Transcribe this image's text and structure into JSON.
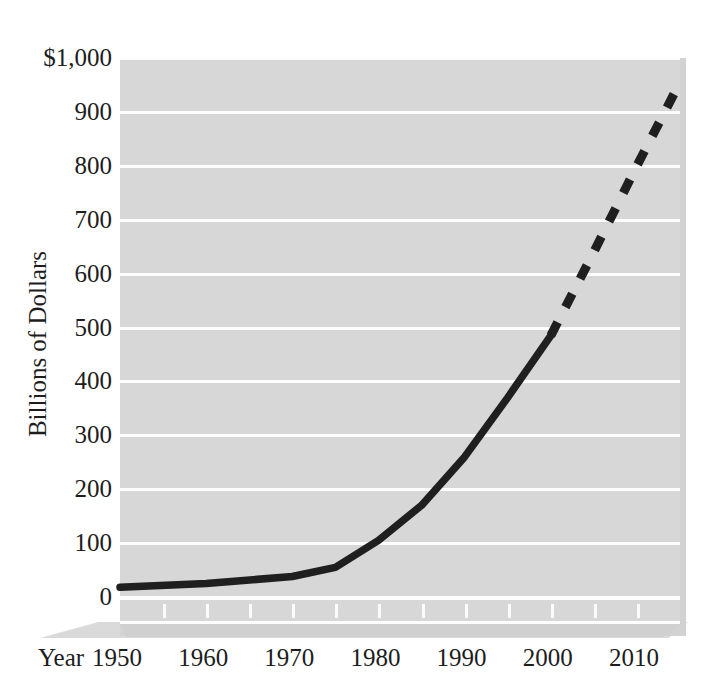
{
  "chart_data": {
    "type": "line",
    "title": "",
    "subtitle": "",
    "xlabel": "Year",
    "ylabel": "Billions of Dollars",
    "xlim": [
      1950,
      2015
    ],
    "ylim": [
      0,
      1000
    ],
    "grid": true,
    "legend": null,
    "x_ticks": [
      "1950",
      "1960",
      "1970",
      "1980",
      "1990",
      "2000",
      "2010"
    ],
    "x_tick_values": [
      1950,
      1960,
      1970,
      1980,
      1990,
      2000,
      2010
    ],
    "x_minor_tick_interval": 5,
    "y_ticks": [
      "0",
      "100",
      "200",
      "300",
      "400",
      "500",
      "600",
      "700",
      "800",
      "900",
      "$1,000"
    ],
    "y_tick_values": [
      0,
      100,
      200,
      300,
      400,
      500,
      600,
      700,
      800,
      900,
      1000
    ],
    "series": [
      {
        "name": "Actual",
        "style": "solid",
        "color": "#1f1f1f",
        "x": [
          1950,
          1960,
          1970,
          1975,
          1980,
          1985,
          1990,
          1995,
          2000
        ],
        "values": [
          18,
          25,
          38,
          55,
          105,
          170,
          260,
          370,
          485
        ]
      },
      {
        "name": "Projected",
        "style": "dashed",
        "color": "#1f1f1f",
        "x": [
          2000,
          2005,
          2010,
          2015
        ],
        "values": [
          485,
          640,
          800,
          955
        ]
      }
    ],
    "annotations": []
  },
  "axis": {
    "y_title": "Billions of Dollars",
    "x_title": "Year",
    "y_labels": [
      "$1,000",
      "900",
      "800",
      "700",
      "600",
      "500",
      "400",
      "300",
      "200",
      "100",
      "0"
    ],
    "x_labels": [
      "1950",
      "1960",
      "1970",
      "1980",
      "1990",
      "2000",
      "2010"
    ]
  },
  "style": {
    "plot_background": "#d7d7d7",
    "gridline_color": "#fdfdfd",
    "line_color": "#1f1f1f",
    "text_color": "#1d1d1d",
    "page_background": "#ffffff"
  }
}
